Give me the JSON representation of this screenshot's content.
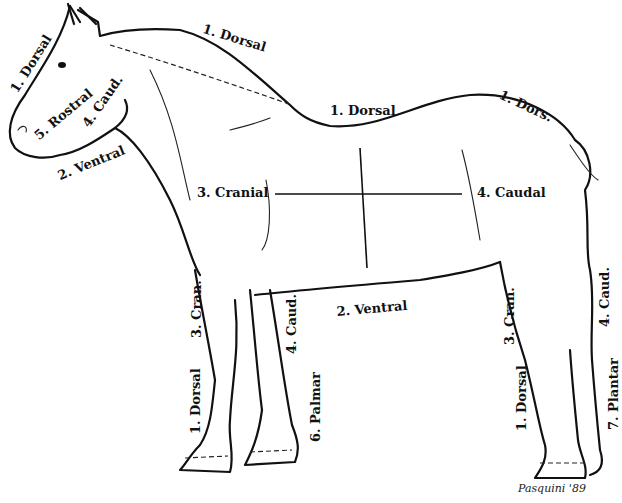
{
  "diagram": {
    "labels": {
      "head_dorsal": "1. Dorsal",
      "head_rostral": "5. Rostral",
      "head_caudal": "4. Caud.",
      "head_ventral": "2. Ventral",
      "neck_dorsal": "1. Dorsal",
      "back_dorsal": "1. Dorsal",
      "rump_dorsal": "1. Dors.",
      "trunk_cranial": "3. Cranial",
      "trunk_caudal": "4. Caudal",
      "trunk_ventral": "2. Ventral",
      "foreleg_cranial": "3. Cran.",
      "foreleg_caudal": "4. Caud.",
      "foreleg_dorsal": "1. Dorsal",
      "foreleg_palmar": "6. Palmar",
      "hindleg_cranial": "3. Cran.",
      "hindleg_caudal": "4. Caud.",
      "hindleg_dorsal": "1. Dorsal",
      "hindleg_plantar": "7. Plantar"
    },
    "signature": "Pasquini '89"
  }
}
